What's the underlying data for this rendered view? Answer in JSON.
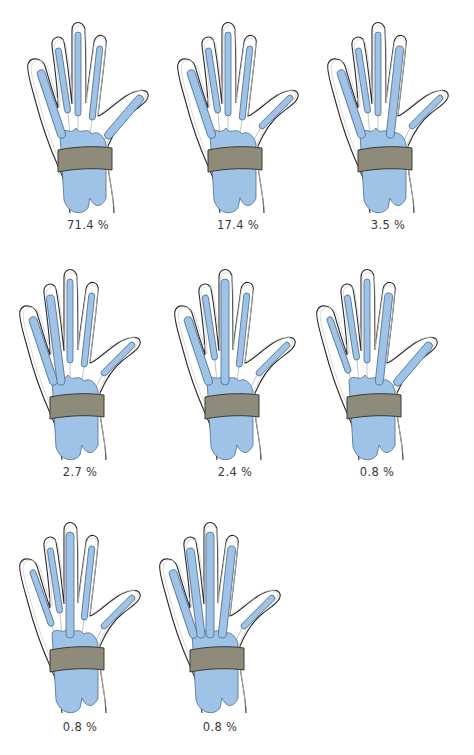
{
  "figure": {
    "colors": {
      "sheath_fill": "#9fc3e6",
      "sheath_stroke": "#4a6c92",
      "retinaculum_band": "#8f8b7a",
      "outline": "#2b2b2b"
    },
    "panels": [
      {
        "id": 1,
        "label": "71.4 %",
        "connected": {
          "little": true,
          "ring": false,
          "middle": false,
          "index": false,
          "thumb": true
        }
      },
      {
        "id": 2,
        "label": "17.4 %",
        "connected": {
          "little": true,
          "ring": false,
          "middle": false,
          "index": false,
          "thumb": false
        }
      },
      {
        "id": 3,
        "label": "3.5 %",
        "connected": {
          "little": true,
          "ring": false,
          "middle": false,
          "index": true,
          "thumb": false
        }
      },
      {
        "id": 4,
        "label": "2.7 %",
        "connected": {
          "little": true,
          "ring": true,
          "middle": false,
          "index": false,
          "thumb": false
        }
      },
      {
        "id": 5,
        "label": "2.4 %",
        "connected": {
          "little": true,
          "ring": false,
          "middle": true,
          "index": false,
          "thumb": false
        }
      },
      {
        "id": 6,
        "label": "0.8 %",
        "connected": {
          "little": false,
          "ring": false,
          "middle": false,
          "index": true,
          "thumb": true
        }
      },
      {
        "id": 7,
        "label": "0.8 %",
        "connected": {
          "little": false,
          "ring": false,
          "middle": true,
          "index": false,
          "thumb": false
        }
      },
      {
        "id": 8,
        "label": "0.8 %",
        "connected": {
          "little": true,
          "ring": true,
          "middle": true,
          "index": true,
          "thumb": false
        }
      }
    ]
  }
}
